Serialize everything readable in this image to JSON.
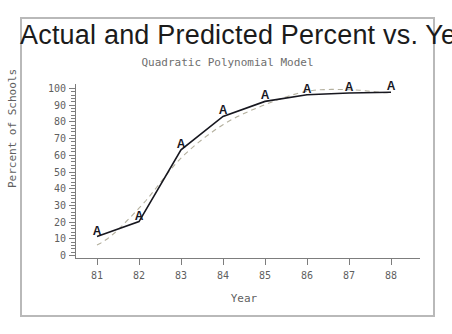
{
  "chart_data": {
    "type": "line",
    "title": "Actual and Predicted Percent vs. Year",
    "subtitle": "Quadratic Polynomial Model",
    "xlabel": "Year",
    "ylabel": "Percent of Schools",
    "xlim": [
      80.5,
      88.5
    ],
    "ylim": [
      0,
      100
    ],
    "grid": false,
    "legend": "none",
    "marker_glyph": "A",
    "colors": {
      "actual": "#17171f",
      "predicted": "#b4b09e"
    },
    "categories": [
      "81",
      "82",
      "83",
      "84",
      "85",
      "86",
      "87",
      "88"
    ],
    "x": [
      81,
      82,
      83,
      84,
      85,
      86,
      87,
      88
    ],
    "xticklabels": [
      "81",
      "82",
      "83",
      "84",
      "85",
      "86",
      "87",
      "88"
    ],
    "yticklabels": [
      "0",
      "10",
      "20",
      "30",
      "40",
      "50",
      "60",
      "70",
      "80",
      "90",
      "100"
    ],
    "yticks": [
      0,
      10,
      20,
      30,
      40,
      50,
      60,
      70,
      80,
      90,
      100
    ],
    "series": [
      {
        "name": "Actual",
        "style": "solid-line-with-A-markers",
        "values": [
          11,
          20,
          63,
          83,
          92,
          96,
          97,
          97.5
        ]
      },
      {
        "name": "Predicted",
        "style": "dashed-line",
        "values": [
          6,
          28,
          58,
          78,
          90,
          98,
          99,
          97
        ]
      }
    ]
  },
  "axes": {
    "y_title": "Percent of Schools",
    "x_title": "Year"
  },
  "header": {
    "title": "Actual and Predicted Percent vs. Year",
    "subtitle": "Quadratic Polynomial Model"
  }
}
